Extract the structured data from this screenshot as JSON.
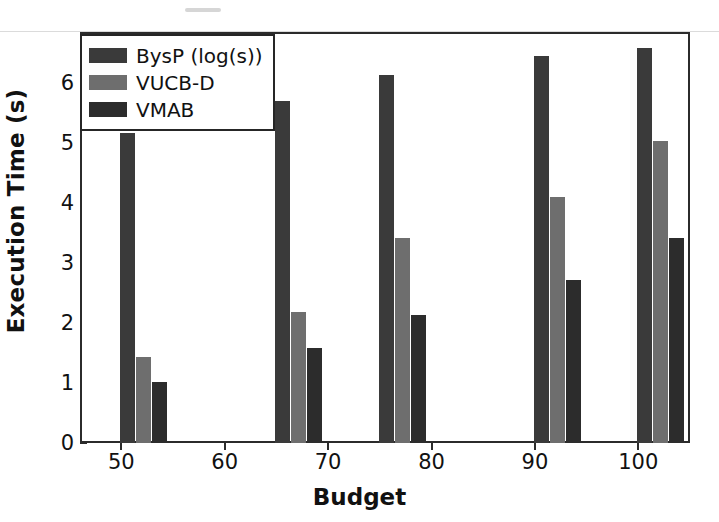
{
  "figure": {
    "background_color": "#ffffff",
    "frame_color": "#2b2b2b"
  },
  "legend": {
    "position": "upper-left",
    "entries": [
      {
        "label": "BysP (log(s))",
        "color": "#3a3a3a"
      },
      {
        "label": "VUCB-D",
        "color": "#6e6e6e"
      },
      {
        "label": "VMAB",
        "color": "#2c2c2c"
      }
    ]
  },
  "axes": {
    "x_title": "Budget",
    "y_title": "Execution Time (s)",
    "x_ticks": [
      "50",
      "60",
      "70",
      "80",
      "90",
      "100"
    ],
    "y_ticks": [
      "0",
      "1",
      "2",
      "3",
      "4",
      "5",
      "6"
    ]
  },
  "chart_data": {
    "type": "bar",
    "title": "",
    "xlabel": "Budget",
    "ylabel": "Execution Time (s)",
    "categories": [
      50,
      65,
      75,
      90,
      100
    ],
    "x": [
      50,
      65,
      75,
      90,
      100
    ],
    "xlim": [
      46,
      105
    ],
    "ylim": [
      0,
      6.9
    ],
    "xticks": [
      50,
      60,
      70,
      80,
      90,
      100
    ],
    "yticks": [
      0,
      1,
      2,
      3,
      4,
      5,
      6
    ],
    "grid": false,
    "legend_position": "upper left",
    "bar_width": 1.5,
    "series": [
      {
        "name": "BysP (log(s))",
        "color": "#3a3a3a",
        "values": [
          5.17,
          5.7,
          6.13,
          6.45,
          6.58
        ]
      },
      {
        "name": "VUCB-D",
        "color": "#6e6e6e",
        "values": [
          1.43,
          2.19,
          3.42,
          4.1,
          5.03
        ]
      },
      {
        "name": "VMAB",
        "color": "#2c2c2c",
        "values": [
          1.02,
          1.58,
          2.13,
          2.71,
          3.42
        ]
      }
    ]
  }
}
